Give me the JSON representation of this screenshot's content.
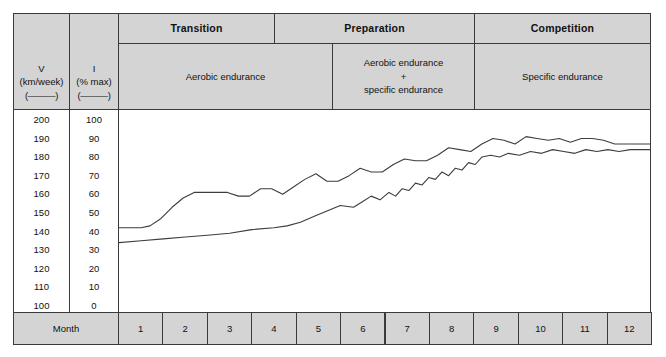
{
  "table": {
    "axis_headers": [
      {
        "name": "V",
        "unit": "(km/week)",
        "marker": "(———)"
      },
      {
        "name": "I",
        "unit": "(% max)",
        "marker": "(———)"
      }
    ],
    "periods": [
      {
        "label": "Transition"
      },
      {
        "label": "Preparation"
      },
      {
        "label": "Competition"
      }
    ],
    "training_focus": [
      {
        "label": "Aerobic endurance"
      },
      {
        "label": "Aerobic endurance\n+\nspecific endurance"
      },
      {
        "label": "Specific endurance"
      }
    ],
    "month_row_label": "Month",
    "months": [
      "1",
      "2",
      "3",
      "4",
      "5",
      "6",
      "7",
      "8",
      "9",
      "10",
      "11",
      "12"
    ]
  },
  "colors": {
    "header_fill": "#d4d4d4",
    "border": "#3a3a3a",
    "line": "#3d3d3d",
    "plot_bg": "#ffffff"
  },
  "chart_data": {
    "type": "line",
    "title": "",
    "xlabel": "Month",
    "ylabel": "V (km/week) / I (% max)",
    "grid": false,
    "legend": "none",
    "x": [
      1,
      2,
      3,
      4,
      5,
      6,
      7,
      8,
      9,
      10,
      11,
      12
    ],
    "xlim": [
      0.5,
      12.5
    ],
    "axes": [
      {
        "name": "V",
        "unit": "km/week",
        "ticks": [
          200,
          190,
          180,
          170,
          160,
          150,
          140,
          130,
          120,
          110,
          100
        ],
        "ylim": [
          100,
          200
        ]
      },
      {
        "name": "I",
        "unit": "% max",
        "ticks": [
          100,
          90,
          80,
          70,
          60,
          50,
          40,
          30,
          20,
          10,
          0
        ],
        "ylim": [
          0,
          100
        ]
      }
    ],
    "series": [
      {
        "name": "V (km/week)",
        "axis": "V",
        "unit": "km/week",
        "x": [
          0.5,
          0.8,
          1.0,
          1.2,
          1.45,
          1.7,
          1.95,
          2.2,
          2.45,
          2.7,
          2.95,
          3.2,
          3.45,
          3.7,
          3.95,
          4.2,
          4.45,
          4.7,
          4.95,
          5.2,
          5.45,
          5.7,
          5.95,
          6.2,
          6.45,
          6.7,
          6.95,
          7.2,
          7.45,
          7.7,
          7.95,
          8.2,
          8.45,
          8.7,
          8.95,
          9.2,
          9.45,
          9.7,
          9.95,
          10.2,
          10.45,
          10.7,
          10.95,
          11.2,
          11.45,
          11.7,
          11.95,
          12.3,
          12.5
        ],
        "values": [
          141,
          141,
          141,
          142,
          146,
          152,
          157,
          160,
          160,
          160,
          160,
          158,
          158,
          162,
          162,
          159,
          163,
          167,
          170,
          166,
          166,
          169,
          173,
          171,
          171,
          175,
          178,
          177,
          177,
          180,
          184,
          183,
          182,
          186,
          189,
          188,
          186,
          190,
          189,
          188,
          189,
          187,
          189,
          189,
          188,
          186,
          186,
          186,
          186
        ]
      },
      {
        "name": "I (% max)",
        "axis": "I",
        "unit": "% max",
        "x": [
          0.5,
          1.0,
          1.5,
          2.0,
          2.5,
          3.0,
          3.5,
          4.0,
          4.3,
          4.6,
          4.9,
          5.2,
          5.5,
          5.8,
          6.0,
          6.2,
          6.4,
          6.6,
          6.75,
          6.9,
          7.05,
          7.2,
          7.35,
          7.5,
          7.65,
          7.8,
          7.95,
          8.1,
          8.25,
          8.4,
          8.55,
          8.7,
          8.9,
          9.1,
          9.3,
          9.55,
          9.8,
          10.05,
          10.3,
          10.55,
          10.8,
          11.05,
          11.3,
          11.55,
          11.8,
          12.05,
          12.3,
          12.5
        ],
        "values": [
          33,
          34,
          35,
          36,
          37,
          38,
          40,
          41,
          42,
          44,
          47,
          50,
          53,
          52,
          55,
          58,
          56,
          60,
          58,
          62,
          61,
          65,
          64,
          68,
          67,
          71,
          69,
          73,
          72,
          76,
          75,
          79,
          80,
          79,
          81,
          80,
          82,
          81,
          83,
          82,
          81,
          83,
          82,
          83,
          82,
          83,
          83,
          83
        ]
      }
    ]
  }
}
